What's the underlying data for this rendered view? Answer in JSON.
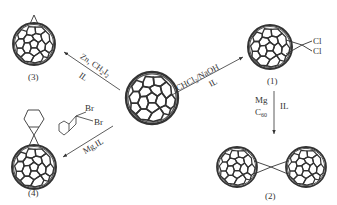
{
  "diagram": {
    "center_molecule": "C60",
    "compounds": [
      {
        "id": "1",
        "label": "(1)",
        "substituents": [
          "Cl",
          "Cl"
        ],
        "description": "dichloromethano-fullerene"
      },
      {
        "id": "2",
        "label": "(2)",
        "description": "C60 dimer bridged by carbon"
      },
      {
        "id": "3",
        "label": "(3)",
        "description": "methano-fullerene"
      },
      {
        "id": "4",
        "label": "(4)",
        "description": "cyclohexyl-spiro fullerene"
      }
    ],
    "reactions": [
      {
        "from": "C60",
        "to": "(1)",
        "reagent_top": "CHCl3/NaOH",
        "reagent_bottom": "IL"
      },
      {
        "from": "(1)",
        "to": "(2)",
        "reagent_left_1": "Mg",
        "reagent_left_2": "C60",
        "reagent_right": "IL"
      },
      {
        "from": "C60",
        "to": "(3)",
        "reagent_top": "Zn, CH2I2",
        "reagent_bottom": "IL"
      },
      {
        "from": "C60",
        "to": "(4)",
        "reagent_top_atoms": [
          "Br",
          "Br"
        ],
        "reagent_bottom": "Mg,IL"
      }
    ]
  },
  "labels": {
    "c1": "(1)",
    "c2": "(2)",
    "c3": "(3)",
    "c4": "(4)",
    "cl1": "Cl",
    "cl2": "Cl",
    "br1": "Br",
    "br2": "Br",
    "r1_top_a": "CHCl",
    "r1_top_sub": "3",
    "r1_top_b": "/NaOH",
    "r1_bottom": "IL",
    "r2_left1": "Mg",
    "r2_left2_a": "C",
    "r2_left2_sub": "60",
    "r2_right": "IL",
    "r3_top_a": "Zn, CH",
    "r3_top_sub1": "2",
    "r3_top_b": "I",
    "r3_top_sub2": "2",
    "r3_bottom": "IL",
    "r4_bottom": "Mg,IL"
  }
}
